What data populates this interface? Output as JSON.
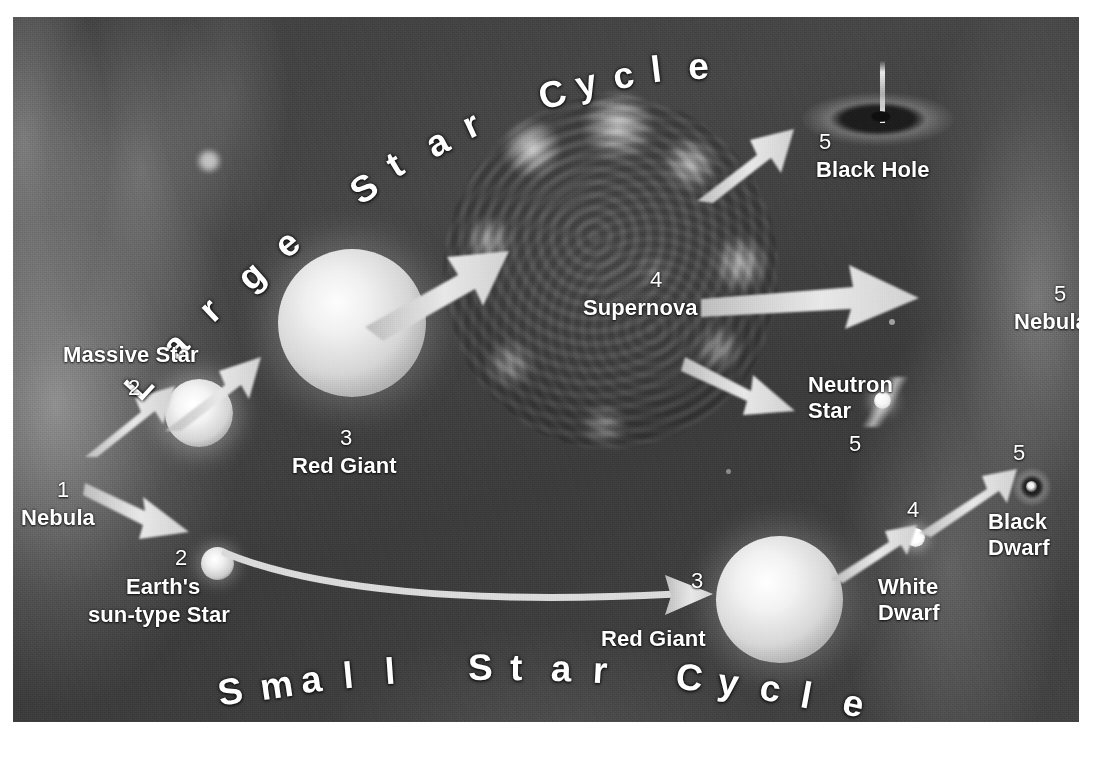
{
  "diagram": {
    "background_color": "#414141",
    "label_color": "#ffffff",
    "arrow_color": "#d9d9d9"
  },
  "titles": [
    {
      "id": "large-star-cycle",
      "text": "Large Star Cycle",
      "position": "top-arc"
    },
    {
      "id": "small-star-cycle",
      "text": "Small Star Cycle",
      "position": "bottom-arc"
    }
  ],
  "large_cycle": {
    "name": "Large Star Cycle",
    "stages": [
      {
        "step": "1",
        "label": "Nebula",
        "x": 52,
        "y": 492
      },
      {
        "step": "2",
        "label": "Massive Star",
        "x": 118,
        "y": 345
      },
      {
        "step": "3",
        "label": "Red Giant",
        "x": 292,
        "y": 443
      },
      {
        "step": "4",
        "label": "Supernova",
        "x": 632,
        "y": 285
      },
      {
        "step": "5",
        "label": "Black Hole",
        "x": 843,
        "y": 145
      },
      {
        "step": "5",
        "label": "Neutron Star",
        "x": 833,
        "y": 378
      },
      {
        "step": "5",
        "label": "Nebula",
        "x": 1022,
        "y": 298
      }
    ]
  },
  "small_cycle": {
    "name": "Small Star Cycle",
    "stages": [
      {
        "step": "1",
        "label": "Nebula",
        "x": 52,
        "y": 492
      },
      {
        "step": "2",
        "label": "Earth's\nsun-type Star",
        "x": 140,
        "y": 558
      },
      {
        "step": "3",
        "label": "Red Giant",
        "x": 660,
        "y": 600
      },
      {
        "step": "4",
        "label": "White\nDwarf",
        "x": 900,
        "y": 498
      },
      {
        "step": "5",
        "label": "Black\nDwarf",
        "x": 1008,
        "y": 468
      }
    ]
  },
  "labels": {
    "large_title": "Large Star Cycle",
    "small_title": "Small Star Cycle",
    "nebula_1": "Nebula",
    "massive_star": "Massive Star",
    "red_giant_large": "Red Giant",
    "supernova": "Supernova",
    "black_hole": "Black Hole",
    "neutron_star_line1": "Neutron",
    "neutron_star_line2": "Star",
    "nebula_5": "Nebula",
    "earths_line1": "Earth's",
    "earths_line2": "sun-type Star",
    "red_giant_small": "Red Giant",
    "white_dwarf_line1": "White",
    "white_dwarf_line2": "Dwarf",
    "black_dwarf_line1": "Black",
    "black_dwarf_line2": "Dwarf",
    "n1": "1",
    "n2": "2",
    "n2b": "2",
    "n3": "3",
    "n3b": "3",
    "n4": "4",
    "n4b": "4",
    "n5_blackhole": "5",
    "n5_neutron": "5",
    "n5_nebula": "5",
    "n5_blackdwarf": "5"
  }
}
